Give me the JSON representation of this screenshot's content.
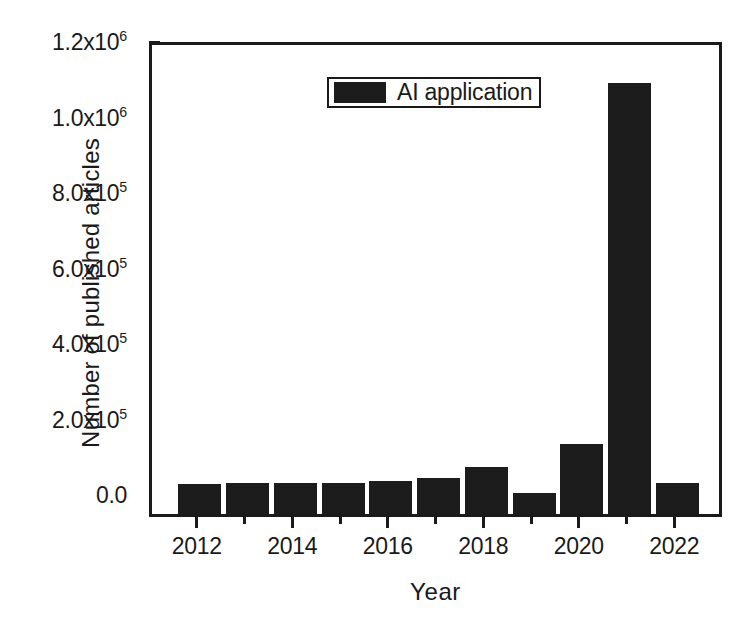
{
  "chart_data": {
    "type": "bar",
    "title": "",
    "subtitle": "",
    "xlabel": "Year",
    "ylabel": "Number of published articles",
    "categories": [
      2012,
      2013,
      2014,
      2015,
      2016,
      2017,
      2018,
      2019,
      2020,
      2021,
      2022
    ],
    "values": [
      37000,
      40000,
      40000,
      40000,
      45000,
      53000,
      82000,
      12000,
      143000,
      1100000,
      40000
    ],
    "series": [
      {
        "name": "AI application",
        "color": "#1c1c1c",
        "values": [
          37000,
          40000,
          40000,
          40000,
          45000,
          53000,
          82000,
          12000,
          143000,
          1100000,
          40000
        ]
      }
    ],
    "xlim": [
      2011.0,
      2023.0
    ],
    "ylim": [
      -20000,
      1200000
    ],
    "grid": false,
    "legend_position": "top-center",
    "legend_entries": [
      "AI application"
    ],
    "annotations": []
  },
  "axes": {
    "y": {
      "title": "Number of published articles",
      "tick_labels": [
        {
          "text": "0.0",
          "mantissa": "0.0",
          "exponent": "",
          "value": 0
        },
        {
          "text": "2.0x10^5",
          "mantissa": "2.0x10",
          "exponent": "5",
          "value": 200000
        },
        {
          "text": "4.0x10^5",
          "mantissa": "4.0x10",
          "exponent": "5",
          "value": 400000
        },
        {
          "text": "6.0x10^5",
          "mantissa": "6.0x10",
          "exponent": "5",
          "value": 600000
        },
        {
          "text": "8.0x10^5",
          "mantissa": "8.0x10",
          "exponent": "5",
          "value": 800000
        },
        {
          "text": "1.0x10^6",
          "mantissa": "1.0x10",
          "exponent": "6",
          "value": 1000000
        },
        {
          "text": "1.2x10^6",
          "mantissa": "1.2x10",
          "exponent": "6",
          "value": 1200000
        }
      ],
      "minor_ticks": [
        100000,
        300000,
        500000,
        700000,
        900000,
        1100000
      ]
    },
    "x": {
      "title": "Year",
      "tick_labels": [
        {
          "text": "2012",
          "value": 2012
        },
        {
          "text": "2014",
          "value": 2014
        },
        {
          "text": "2016",
          "value": 2016
        },
        {
          "text": "2018",
          "value": 2018
        },
        {
          "text": "2020",
          "value": 2020
        },
        {
          "text": "2022",
          "value": 2022
        }
      ],
      "minor_ticks": [
        2013,
        2015,
        2017,
        2019,
        2021
      ]
    }
  },
  "legend": {
    "label": "AI application",
    "swatch_color": "#1c1c1c"
  },
  "style": {
    "axis_color": "#1a1a1a",
    "bar_color": "#1c1c1c",
    "background": "#ffffff"
  }
}
